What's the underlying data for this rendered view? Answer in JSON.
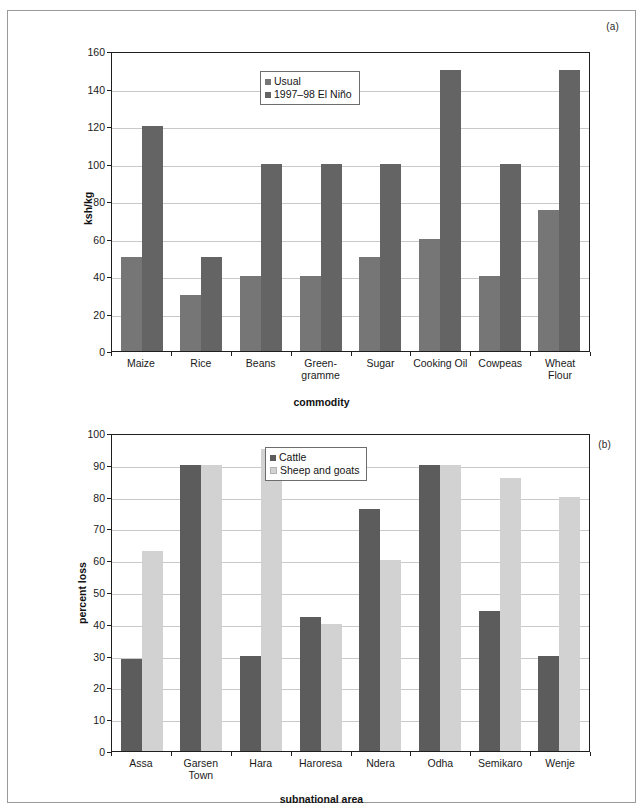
{
  "page": {
    "background": "#ffffff",
    "border_color": "#9a9a9a"
  },
  "panels": [
    {
      "tag": "(a)"
    },
    {
      "tag": "(b)"
    }
  ],
  "chart_data": [
    {
      "type": "bar",
      "panel": "(a)",
      "title": "",
      "xlabel": "commodity",
      "ylabel": "ksh/kg",
      "ylim": [
        0,
        160
      ],
      "ytick_step": 20,
      "yticks": [
        "0",
        "20",
        "40",
        "60",
        "80",
        "100",
        "120",
        "140",
        "160"
      ],
      "grid": true,
      "legend_position": "top-right-inside",
      "categories": [
        "Maize",
        "Rice",
        "Beans",
        "Green-\ngramme",
        "Sugar",
        "Cooking Oil",
        "Cowpeas",
        "Wheat\nFlour"
      ],
      "series": [
        {
          "name": "Usual",
          "color": "#767676",
          "values": [
            50,
            30,
            40,
            40,
            50,
            60,
            40,
            75
          ]
        },
        {
          "name": "1997–98 El Niño",
          "color": "#646464",
          "values": [
            120,
            50,
            100,
            100,
            100,
            150,
            100,
            150
          ]
        }
      ]
    },
    {
      "type": "bar",
      "panel": "(b)",
      "title": "",
      "xlabel": "subnational area",
      "ylabel": "percent loss",
      "ylim": [
        0,
        100
      ],
      "ytick_step": 10,
      "yticks": [
        "0",
        "10",
        "20",
        "30",
        "40",
        "50",
        "60",
        "70",
        "80",
        "90",
        "100"
      ],
      "grid": true,
      "legend_position": "top-center-inside",
      "categories": [
        "Assa",
        "Garsen\nTown",
        "Hara",
        "Haroresa",
        "Ndera",
        "Odha",
        "Semikaro",
        "Wenje"
      ],
      "series": [
        {
          "name": "Cattle",
          "color": "#5c5c5c",
          "values": [
            29,
            90,
            30,
            42,
            76,
            90,
            44,
            30
          ]
        },
        {
          "name": "Sheep and goats",
          "color": "#d2d2d2",
          "values": [
            63,
            90,
            95,
            40,
            60,
            90,
            86,
            80
          ]
        }
      ]
    }
  ]
}
